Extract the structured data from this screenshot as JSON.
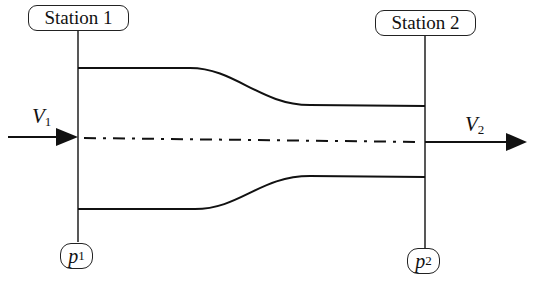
{
  "diagram": {
    "stations": [
      {
        "label": "Station 1",
        "pressure_symbol": "p",
        "pressure_subscript": "1",
        "velocity_symbol": "V",
        "velocity_subscript": "1"
      },
      {
        "label": "Station 2",
        "pressure_symbol": "p",
        "pressure_subscript": "2",
        "velocity_symbol": "V",
        "velocity_subscript": "2"
      }
    ],
    "elements": {
      "upper_wall": "duct upper wall (converging)",
      "lower_wall": "duct lower wall (converging)",
      "centerline": "dash-dot centreline",
      "inlet_arrow": "inflow velocity arrow",
      "outlet_arrow": "outflow velocity arrow"
    },
    "colors": {
      "line": "#111111",
      "background": "#ffffff"
    }
  }
}
